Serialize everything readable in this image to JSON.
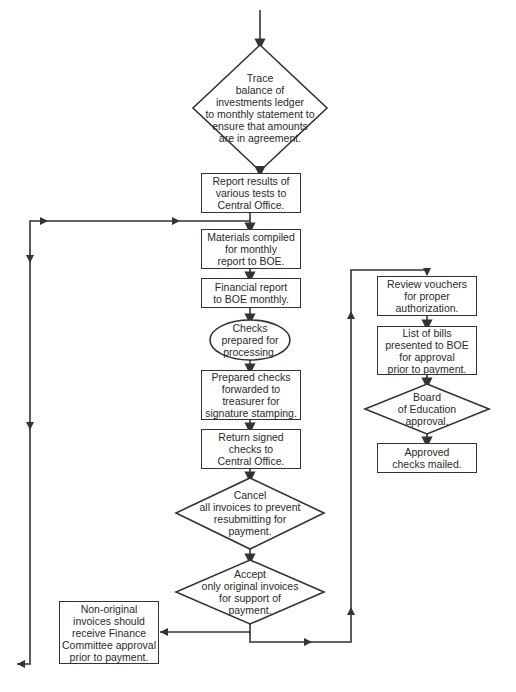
{
  "diagram": {
    "type": "flowchart",
    "line_color": "#333333",
    "nodes": {
      "trace": {
        "shape": "diamond",
        "label": "Trace\nbalance of\ninvestments ledger\nto monthly statement to\nensure that amounts\nare in agreement."
      },
      "report_results": {
        "shape": "rectangle",
        "label": "Report results of\nvarious tests to\nCentral Office."
      },
      "materials": {
        "shape": "rectangle",
        "label": "Materials compiled\nfor monthly\nreport to BOE."
      },
      "financial": {
        "shape": "rectangle",
        "label": "Financial report\nto BOE monthly."
      },
      "checks_prepared": {
        "shape": "ellipse",
        "label": "Checks\nprepared for\nprocessing."
      },
      "prepared_checks": {
        "shape": "rectangle",
        "label": "Prepared checks\nforwarded to\ntreasurer for\nsignature stamping."
      },
      "return_signed": {
        "shape": "rectangle",
        "label": "Return signed\nchecks to\nCentral Office."
      },
      "cancel": {
        "shape": "diamond",
        "label": "Cancel\nall invoices to prevent\nresubmitting for\npayment."
      },
      "accept": {
        "shape": "diamond",
        "label": "Accept\nonly original invoices\nfor support of\npayment."
      },
      "non_original": {
        "shape": "rectangle",
        "label": "Non-original\ninvoices should\nreceive Finance\nCommittee approval\nprior to payment."
      },
      "review_vouchers": {
        "shape": "rectangle",
        "label": "Review vouchers\nfor proper\nauthorization."
      },
      "list_bills": {
        "shape": "rectangle",
        "label": "List of bills\npresented to BOE\nfor approval\nprior to payment."
      },
      "board": {
        "shape": "diamond",
        "label": "Board\nof Education\napproval."
      },
      "approved": {
        "shape": "rectangle",
        "label": "Approved\nchecks mailed."
      }
    },
    "edges": [
      [
        "start",
        "trace"
      ],
      [
        "trace",
        "report_results"
      ],
      [
        "report_results",
        "materials"
      ],
      [
        "report_results",
        "left_branch_off_page"
      ],
      [
        "materials",
        "financial"
      ],
      [
        "financial",
        "checks_prepared"
      ],
      [
        "checks_prepared",
        "prepared_checks"
      ],
      [
        "prepared_checks",
        "return_signed"
      ],
      [
        "return_signed",
        "cancel"
      ],
      [
        "cancel",
        "accept"
      ],
      [
        "accept",
        "non_original"
      ],
      [
        "accept",
        "review_vouchers"
      ],
      [
        "review_vouchers",
        "list_bills"
      ],
      [
        "list_bills",
        "board"
      ],
      [
        "board",
        "approved"
      ]
    ]
  }
}
